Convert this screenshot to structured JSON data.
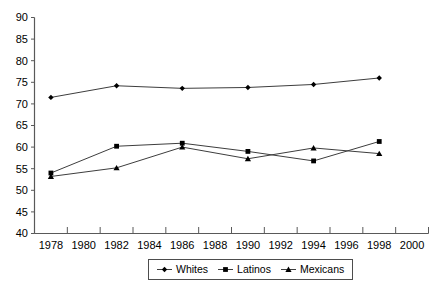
{
  "chart_data": {
    "type": "line",
    "title": "",
    "xlabel": "",
    "ylabel": "",
    "x_tick_labels": [
      1978,
      1980,
      1982,
      1984,
      1986,
      1988,
      1990,
      1992,
      1994,
      1996,
      1998,
      2000
    ],
    "x_tick_interval": 2,
    "y_ticks": [
      40,
      45,
      50,
      55,
      60,
      65,
      70,
      75,
      80,
      85,
      90
    ],
    "ylim": [
      40,
      90
    ],
    "x_years": [
      1978,
      1982,
      1986,
      1990,
      1994,
      1998
    ],
    "series": [
      {
        "name": "Whites",
        "marker": "diamond",
        "values": [
          71.5,
          74.2,
          73.6,
          73.8,
          74.5,
          76.0
        ]
      },
      {
        "name": "Latinos",
        "marker": "square",
        "values": [
          54.0,
          60.2,
          60.9,
          59.0,
          56.8,
          61.3
        ]
      },
      {
        "name": "Mexicans",
        "marker": "triangle",
        "values": [
          53.2,
          55.2,
          60.0,
          57.3,
          59.8,
          58.5
        ]
      }
    ],
    "grid": false,
    "legend_position": "bottom",
    "colors": {
      "axis": "#595959",
      "line": "#3d3d3d",
      "marker": "#000000",
      "text": "#000000",
      "background": "#ffffff"
    }
  }
}
